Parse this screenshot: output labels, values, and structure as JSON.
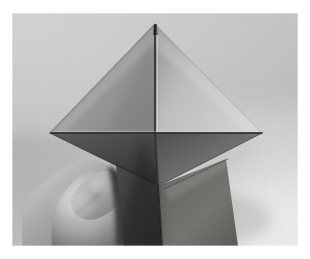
{
  "image": {
    "kind": "photograph",
    "subject": "hand holding folded paper octahedron",
    "color_mode": "grayscale",
    "caption": "A left hand holds a gray folded-paper octahedron (two square pyramids joined at a square equator) upright against a plain studio backdrop.",
    "frame": {
      "border_color": "#ffffff",
      "border_left": 12,
      "border_top": 13,
      "photo_width": 286,
      "photo_height": 233
    },
    "background": {
      "name": "studio-sweep",
      "upper_left_color": "#cdcdcb",
      "lower_right_color": "#f2f2f0",
      "shadow_color": "#8e8e8c"
    },
    "paper": {
      "material": "matte paper",
      "top_left_face_color": "#8f8f8d",
      "top_right_face_color": "#b9b9b7",
      "bottom_left_face_color": "#4a4a48",
      "bottom_right_face_color": "#6e6e6c",
      "lower_flap_color": "#585856",
      "crease_color": "#3a3a38",
      "highlight_color": "#d4d4d2"
    },
    "hand": {
      "name": "left-hand",
      "skin_midtone": "#9c9c9a",
      "skin_highlight": "#d0d0ce",
      "skin_shadow": "#5c5c5a"
    },
    "geometry": {
      "apex": [
        155,
        24
      ],
      "left_vertex": [
        50,
        133
      ],
      "right_vertex": [
        262,
        133
      ],
      "center": [
        155,
        133
      ],
      "lower_point": [
        158,
        186
      ]
    }
  },
  "labels": {
    "alt": "Hand holding a paper octahedron",
    "photo_region": "photograph",
    "subject_region": "origami-octahedron"
  }
}
